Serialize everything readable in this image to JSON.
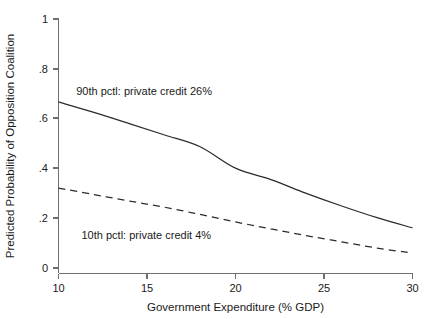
{
  "chart_data": {
    "type": "line",
    "title": "",
    "subtitle": "",
    "xlabel": "Government Expenditure (% GDP)",
    "ylabel": "Predicted Probability of Opposition Coalition",
    "xlim": [
      10,
      30
    ],
    "ylim": [
      0,
      1
    ],
    "xticks": [
      10,
      15,
      20,
      25,
      30
    ],
    "xticklabels": [
      "10",
      "15",
      "20",
      "25",
      "30"
    ],
    "yticks": [
      0,
      0.2,
      0.4,
      0.6,
      0.8,
      1
    ],
    "yticklabels": [
      "0",
      ".2",
      ".4",
      ".6",
      ".8",
      "1"
    ],
    "grid": false,
    "legend_position": "inline-annotations",
    "x": [
      10,
      12,
      14,
      16,
      18,
      20,
      22,
      24,
      26,
      28,
      30
    ],
    "series": [
      {
        "name": "90th pctl: private credit 26%",
        "style": "solid",
        "color": "#2b2b2b",
        "annotation": "90th pctl: private credit 26%",
        "annotation_x": 11.0,
        "annotation_y": 0.695,
        "values": [
          0.667,
          0.625,
          0.58,
          0.534,
          0.487,
          0.401,
          0.355,
          0.3,
          0.249,
          0.202,
          0.161
        ]
      },
      {
        "name": "10th pctl: private credit 4%",
        "style": "dashed",
        "color": "#2b2b2b",
        "annotation": "10th pctl: private credit 4%",
        "annotation_x": 11.3,
        "annotation_y": 0.115,
        "values": [
          0.321,
          0.295,
          0.269,
          0.244,
          0.215,
          0.185,
          0.157,
          0.13,
          0.105,
          0.08,
          0.06
        ]
      }
    ]
  }
}
